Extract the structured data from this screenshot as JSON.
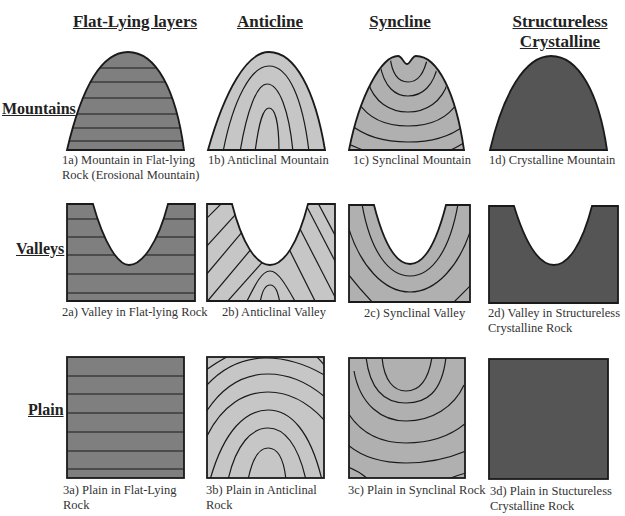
{
  "colors": {
    "flat": "#7f7f7f",
    "anticline": "#c6c6c6",
    "syncline": "#b0b0b0",
    "crystalline": "#555555",
    "stroke": "#1a1a1a"
  },
  "columns": [
    {
      "id": "flat",
      "label": "Flat-Lying layers"
    },
    {
      "id": "anticline",
      "label": "Anticline"
    },
    {
      "id": "syncline",
      "label": "Syncline"
    },
    {
      "id": "crystalline",
      "label_line1": "Structureless",
      "label_line2": "Crystalline"
    }
  ],
  "rows": [
    {
      "id": "mountains",
      "label": "Mountains"
    },
    {
      "id": "valleys",
      "label": "Valleys"
    },
    {
      "id": "plain",
      "label": "Plain"
    }
  ],
  "captions": {
    "1a": {
      "line1": "1a) Mountain in Flat-lying",
      "line2": "Rock (Erosional Mountain)"
    },
    "1b": {
      "line1": "1b) Anticlinal Mountain"
    },
    "1c": {
      "line1": "1c) Synclinal Mountain"
    },
    "1d": {
      "line1": "1d) Crystalline Mountain"
    },
    "2a": {
      "line1": "2a) Valley in Flat-lying Rock"
    },
    "2b": {
      "line1": "2b) Anticlinal Valley"
    },
    "2c": {
      "line1": "2c) Synclinal Valley"
    },
    "2d": {
      "line1": "2d) Valley in Structureless",
      "line2": "Crystalline Rock"
    },
    "3a": {
      "line1": "3a) Plain in Flat-Lying",
      "line2": "Rock"
    },
    "3b": {
      "line1": "3b) Plain in Anticlinal",
      "line2": "Rock"
    },
    "3c": {
      "line1": "3c) Plain in Synclinal Rock"
    },
    "3d": {
      "line1": "3d) Plain in Stuctureless",
      "line2": "Crystalline Rock"
    }
  }
}
